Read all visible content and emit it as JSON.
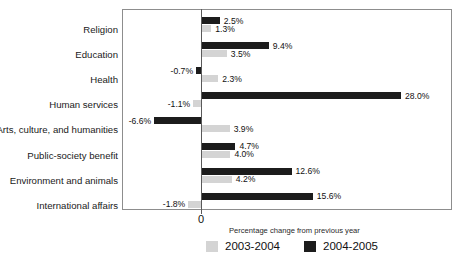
{
  "title_sliver": "· ·",
  "axis": {
    "zero_label": "0",
    "caption": "Percentage change from previous year"
  },
  "legend": {
    "items": [
      {
        "label": "2003-2004",
        "swatch": "light",
        "color": "#d4d4d4"
      },
      {
        "label": "2004-2005",
        "swatch": "dark",
        "color": "#1c1c1c"
      }
    ]
  },
  "chart_data": {
    "type": "bar",
    "orientation": "horizontal",
    "title": "",
    "xlabel": "Percentage change from previous year",
    "ylabel": "",
    "grid": false,
    "legend_position": "bottom",
    "axis_ranges": {
      "x": [
        -8,
        38
      ]
    },
    "zero_reference": 0,
    "categories": [
      "Religion",
      "Education",
      "Health",
      "Human services",
      "Arts, culture, and humanities",
      "Public-society benefit",
      "Environment and animals",
      "International affairs"
    ],
    "series": [
      {
        "name": "2004-2005",
        "color": "#1c1c1c",
        "values": [
          2.5,
          9.4,
          -0.7,
          28.0,
          -6.6,
          4.7,
          12.6,
          15.6
        ],
        "labels": [
          "2.5%",
          "9.4%",
          "-0.7%",
          "28.0%",
          "-6.6%",
          "4.7%",
          "12.6%",
          "15.6%"
        ]
      },
      {
        "name": "2003-2004",
        "color": "#d4d4d4",
        "values": [
          1.3,
          3.5,
          2.3,
          -1.1,
          3.9,
          4.0,
          4.2,
          -1.8
        ],
        "labels": [
          "1.3%",
          "3.5%",
          "2.3%",
          "-1.1%",
          "3.9%",
          "4.0%",
          "4.2%",
          "-1.8%"
        ]
      }
    ]
  }
}
